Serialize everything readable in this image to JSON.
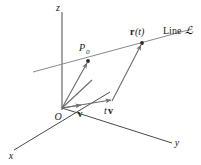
{
  "figure": {
    "background_color": "#ffffff",
    "axis_color": "#4a4a4a",
    "line_color": "#8a8a8a",
    "vector_color": "#6b6b6b",
    "point_color": "#2b2b2b"
  },
  "axes": {
    "x": {
      "label": "x"
    },
    "y": {
      "label": "y"
    },
    "z": {
      "label": "z"
    },
    "origin": {
      "label": "O"
    }
  },
  "labels": {
    "point_p0": "P",
    "point_p0_sub": "0",
    "vector_r": "r",
    "vector_r_arg": "(t)",
    "line_name_word": "Line",
    "line_name_symbol": "ℒ",
    "vector_v": "v",
    "vector_tv_scalar": "t",
    "vector_tv_vec": "v"
  },
  "geometry": {
    "origin": {
      "x": 62,
      "y": 108
    },
    "z_axis_end": {
      "x": 62,
      "y": 12
    },
    "y_axis_end": {
      "x": 172,
      "y": 143
    },
    "x_axis_end": {
      "x": 14,
      "y": 150
    },
    "x_axis_start": {
      "x": 110,
      "y": 92
    },
    "point_p0": {
      "x": 88,
      "y": 61
    },
    "point_rt": {
      "x": 142,
      "y": 43
    },
    "line_start": {
      "x": 33,
      "y": 72
    },
    "line_end": {
      "x": 192,
      "y": 29
    },
    "v_tip": {
      "x": 82,
      "y": 106
    },
    "tv_tip": {
      "x": 112,
      "y": 101
    },
    "extra_ray_tip": {
      "x": 92,
      "y": 80
    }
  }
}
